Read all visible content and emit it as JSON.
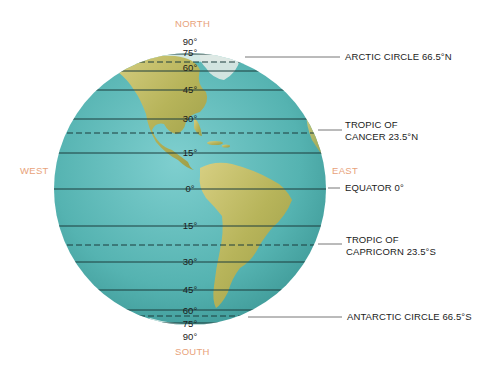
{
  "directions": {
    "north": "NORTH",
    "south": "SOUTH",
    "west": "WEST",
    "east": "EAST"
  },
  "latitudes_north": [
    "90°",
    "75°",
    "60°",
    "45°",
    "30°",
    "15°"
  ],
  "equator_label": "0°",
  "latitudes_south": [
    "15°",
    "30°",
    "45°",
    "60°",
    "75°",
    "90°"
  ],
  "circles": {
    "arctic": "ARCTIC CIRCLE 66.5°N",
    "cancer_line1": "TROPIC OF",
    "cancer_line2": "CANCER 23.5°N",
    "equator": "EQUATOR 0°",
    "capricorn_line1": "TROPIC OF",
    "capricorn_line2": "CAPRICORN 23.5°S",
    "antarctic": "ANTARCTIC CIRCLE 66.5°S"
  },
  "colors": {
    "ocean": "#5bb7b5",
    "land": "#c9c26a",
    "direction_text": "#e8a27a",
    "line": "#1d3c3c"
  }
}
